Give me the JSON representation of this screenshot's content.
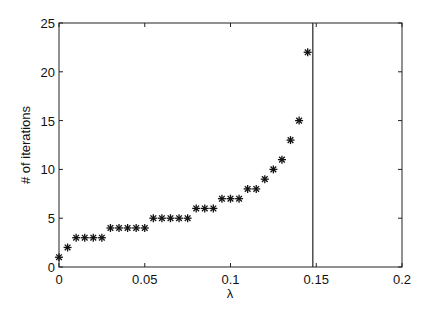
{
  "chart_data": {
    "type": "scatter",
    "title": "",
    "xlabel": "λ",
    "ylabel": "# of iterations",
    "xlim": [
      0,
      0.2
    ],
    "ylim": [
      0,
      25
    ],
    "xticks": [
      0,
      0.05,
      0.1,
      0.15,
      0.2
    ],
    "xtick_labels": [
      "0",
      "0.05",
      "0.1",
      "0.15",
      "0.2"
    ],
    "yticks": [
      0,
      5,
      10,
      15,
      20,
      25
    ],
    "ytick_labels": [
      "0",
      "5",
      "10",
      "15",
      "20",
      "25"
    ],
    "grid": false,
    "legend": null,
    "marker": "asterisk",
    "series": [
      {
        "name": "iterations",
        "x": [
          0,
          0.005,
          0.01,
          0.015,
          0.02,
          0.025,
          0.03,
          0.035,
          0.04,
          0.045,
          0.05,
          0.055,
          0.06,
          0.065,
          0.07,
          0.075,
          0.08,
          0.085,
          0.09,
          0.095,
          0.1,
          0.105,
          0.11,
          0.115,
          0.12,
          0.125,
          0.13,
          0.135,
          0.14,
          0.145
        ],
        "y": [
          1,
          2,
          3,
          3,
          3,
          3,
          4,
          4,
          4,
          4,
          4,
          5,
          5,
          5,
          5,
          5,
          6,
          6,
          6,
          7,
          7,
          7,
          8,
          8,
          9,
          10,
          11,
          13,
          15,
          22
        ]
      }
    ],
    "annotations": [
      {
        "type": "vertical_line",
        "x": 0.148
      }
    ]
  }
}
